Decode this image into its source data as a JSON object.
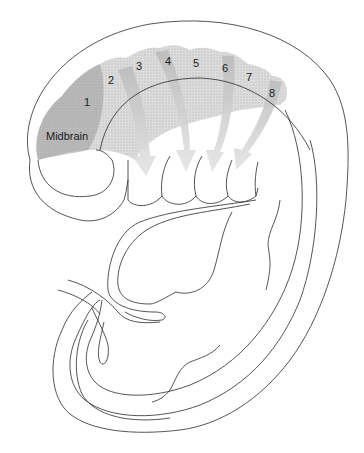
{
  "diagram": {
    "labels": {
      "midbrain": "Midbrain",
      "segments": [
        "1",
        "2",
        "3",
        "4",
        "5",
        "6",
        "7",
        "8"
      ]
    },
    "colors": {
      "line": "#2a2a2a",
      "shade_dark": "#8a8a8a",
      "shade_light": "#d8d8d8",
      "background": "#ffffff"
    }
  }
}
